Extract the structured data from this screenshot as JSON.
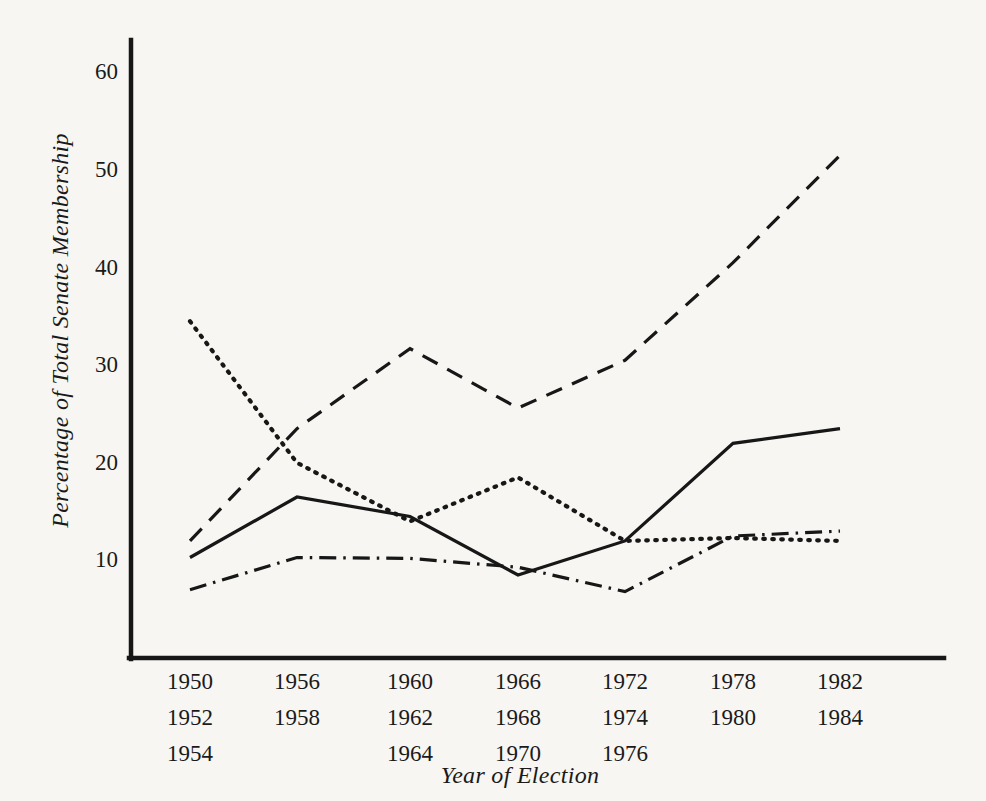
{
  "chart_data": {
    "type": "line",
    "title": "",
    "xlabel": "Year of Election",
    "ylabel": "Percentage of Total Senate Membership",
    "ylim": [
      0,
      65
    ],
    "yticks": [
      10,
      20,
      30,
      40,
      50,
      60
    ],
    "grid": false,
    "legend": "none",
    "x_group_labels": [
      [
        "1950",
        "1952",
        "1954"
      ],
      [
        "1956",
        "1958",
        ""
      ],
      [
        "1960",
        "1962",
        "1964"
      ],
      [
        "1966",
        "1968",
        "1970"
      ],
      [
        "1972",
        "1974",
        "1976"
      ],
      [
        "1978",
        "1980",
        ""
      ],
      [
        "1982",
        "1984",
        ""
      ]
    ],
    "x_positions": [
      1,
      2,
      3,
      4,
      5,
      6,
      7
    ],
    "series": [
      {
        "name": "dotted-series",
        "style": "dotted",
        "values": [
          34.5,
          20.0,
          14.0,
          18.5,
          12.0,
          12.3,
          12.0
        ]
      },
      {
        "name": "dashed-series",
        "style": "dashed",
        "values": [
          12.0,
          23.5,
          31.7,
          25.6,
          30.5,
          40.5,
          51.5
        ]
      },
      {
        "name": "solid-series",
        "style": "solid",
        "values": [
          10.3,
          16.5,
          14.5,
          8.5,
          12.0,
          22.0,
          23.5
        ]
      },
      {
        "name": "dashdot-series",
        "style": "dashdot",
        "values": [
          7.0,
          10.3,
          10.2,
          9.3,
          6.8,
          12.5,
          13.0
        ]
      }
    ],
    "line_color": "#171717"
  },
  "axes": {
    "y_label_text": "Percentage of Total Senate Membership",
    "x_label_text": "Year of Election",
    "y_tick_labels": [
      "60",
      "50",
      "40",
      "30",
      "20",
      "10"
    ]
  }
}
